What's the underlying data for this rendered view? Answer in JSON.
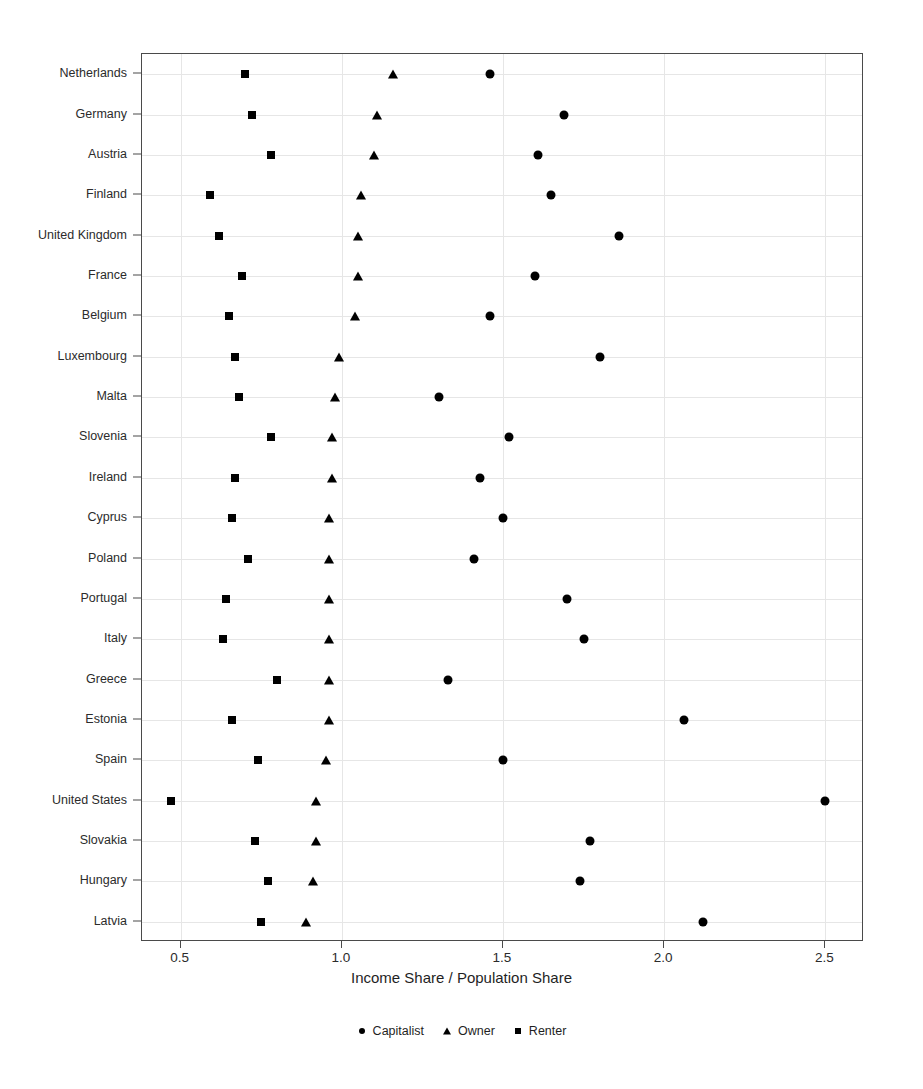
{
  "chart_data": {
    "type": "scatter",
    "title": "",
    "xlabel": "Income Share / Population Share",
    "ylabel": "",
    "xlim": [
      0.38,
      2.62
    ],
    "xticks": [
      0.5,
      1.0,
      1.5,
      2.0,
      2.5
    ],
    "xtick_labels": [
      "0.5",
      "1.0",
      "1.5",
      "2.0",
      "2.5"
    ],
    "grid": true,
    "legend_position": "bottom",
    "orientation": "horizontal",
    "categories": [
      "Netherlands",
      "Germany",
      "Austria",
      "Finland",
      "United Kingdom",
      "France",
      "Belgium",
      "Luxembourg",
      "Malta",
      "Slovenia",
      "Ireland",
      "Cyprus",
      "Poland",
      "Portugal",
      "Italy",
      "Greece",
      "Estonia",
      "Spain",
      "United States",
      "Slovakia",
      "Hungary",
      "Latvia"
    ],
    "series": [
      {
        "name": "Capitalist",
        "marker": "circle",
        "color": "#000000",
        "values": [
          1.46,
          1.69,
          1.61,
          1.65,
          1.86,
          1.6,
          1.46,
          1.8,
          1.3,
          1.52,
          1.43,
          1.5,
          1.41,
          1.7,
          1.75,
          1.33,
          2.06,
          1.5,
          2.5,
          1.77,
          1.74,
          2.12
        ]
      },
      {
        "name": "Owner",
        "marker": "triangle",
        "color": "#000000",
        "values": [
          1.16,
          1.11,
          1.1,
          1.06,
          1.05,
          1.05,
          1.04,
          0.99,
          0.98,
          0.97,
          0.97,
          0.96,
          0.96,
          0.96,
          0.96,
          0.96,
          0.96,
          0.95,
          0.92,
          0.92,
          0.91,
          0.89
        ]
      },
      {
        "name": "Renter",
        "marker": "square",
        "color": "#000000",
        "values": [
          0.7,
          0.72,
          0.78,
          0.59,
          0.62,
          0.69,
          0.65,
          0.67,
          0.68,
          0.78,
          0.67,
          0.66,
          0.71,
          0.64,
          0.63,
          0.8,
          0.66,
          0.74,
          0.47,
          0.73,
          0.77,
          0.75
        ]
      }
    ]
  },
  "legend": {
    "entries": [
      {
        "label": "Capitalist",
        "glyph": "circle-marker-icon"
      },
      {
        "label": "Owner",
        "glyph": "triangle-marker-icon"
      },
      {
        "label": "Renter",
        "glyph": "square-marker-icon"
      }
    ]
  },
  "axis": {
    "x_title": "Income Share / Population Share"
  }
}
